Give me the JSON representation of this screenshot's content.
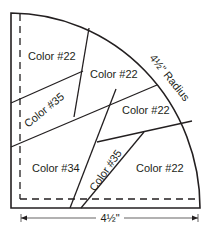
{
  "diagram": {
    "type": "quarter-circle quilt block piecing template",
    "radius_label": "4½\" Radius",
    "width_dimension_label": "4½\"",
    "pieces": [
      {
        "id": "top-left",
        "label": "Color #22"
      },
      {
        "id": "top-middle",
        "label": "Color #22"
      },
      {
        "id": "strip-upper",
        "label": "Color #35"
      },
      {
        "id": "right-middle",
        "label": "Color #22"
      },
      {
        "id": "bottom-left",
        "label": "Color #34"
      },
      {
        "id": "strip-lower",
        "label": "Color #35"
      },
      {
        "id": "bottom-right",
        "label": "Color #22"
      }
    ],
    "colors": {
      "line": "#231f20",
      "background": "#ffffff"
    }
  }
}
